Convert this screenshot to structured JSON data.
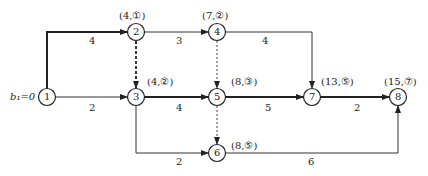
{
  "diagram": {
    "type": "network-plan-shortest-path",
    "start_label": "b₁=0",
    "nodes": [
      {
        "id": "1",
        "label": "1",
        "x": 47,
        "y": 97,
        "mark": ""
      },
      {
        "id": "2",
        "label": "2",
        "x": 136,
        "y": 32,
        "mark": "(4,①)"
      },
      {
        "id": "3",
        "label": "3",
        "x": 136,
        "y": 97,
        "mark": "(4,②)"
      },
      {
        "id": "4",
        "label": "4",
        "x": 217,
        "y": 32,
        "mark": "(7,②)"
      },
      {
        "id": "5",
        "label": "5",
        "x": 217,
        "y": 97,
        "mark": "(8,③)"
      },
      {
        "id": "6",
        "label": "6",
        "x": 217,
        "y": 153,
        "mark": "(8,⑤)"
      },
      {
        "id": "7",
        "label": "7",
        "x": 312,
        "y": 97,
        "mark": "(13,⑤)"
      },
      {
        "id": "8",
        "label": "8",
        "x": 398,
        "y": 97,
        "mark": "(15,⑦)"
      }
    ],
    "edges": [
      {
        "from": "1",
        "to": "2",
        "weight": "4",
        "style": "bold"
      },
      {
        "from": "1",
        "to": "3",
        "weight": "2",
        "style": "normal"
      },
      {
        "from": "2",
        "to": "3",
        "weight": "",
        "style": "dashed-bold"
      },
      {
        "from": "2",
        "to": "4",
        "weight": "3",
        "style": "normal"
      },
      {
        "from": "3",
        "to": "5",
        "weight": "4",
        "style": "bold"
      },
      {
        "from": "3",
        "to": "6",
        "weight": "2",
        "style": "normal"
      },
      {
        "from": "4",
        "to": "5",
        "weight": "",
        "style": "dashed"
      },
      {
        "from": "4",
        "to": "7",
        "weight": "4",
        "style": "normal"
      },
      {
        "from": "5",
        "to": "6",
        "weight": "",
        "style": "dashed"
      },
      {
        "from": "5",
        "to": "7",
        "weight": "5",
        "style": "bold"
      },
      {
        "from": "6",
        "to": "8",
        "weight": "6",
        "style": "normal"
      },
      {
        "from": "7",
        "to": "8",
        "weight": "2",
        "style": "bold"
      }
    ],
    "colors": {
      "line": "#222222",
      "background": "#ffffff"
    }
  }
}
